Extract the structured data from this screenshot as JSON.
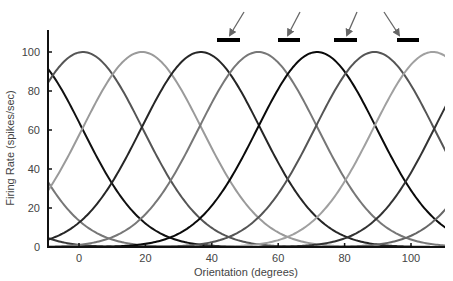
{
  "chart_data": {
    "type": "line",
    "title": "",
    "xlabel": "Orientation (degrees)",
    "ylabel": "Firing Rate (spikes/sec)",
    "xlim": [
      -9.5,
      110
    ],
    "ylim": [
      0,
      100
    ],
    "xticks": [
      0,
      20,
      40,
      60,
      80,
      100
    ],
    "yticks": [
      0,
      20,
      40,
      60,
      80,
      100
    ],
    "grid": false,
    "legend": null,
    "curve_model": "gaussian tuning curve, amplitude 100 spikes/sec, sigma ~18 degrees",
    "series": [
      {
        "name": "neuron pref -54",
        "preferred": -54,
        "amplitude": 100,
        "sigma": 18,
        "color": "#3a3a3a",
        "width": 2
      },
      {
        "name": "neuron pref -36",
        "preferred": -36,
        "amplitude": 100,
        "sigma": 18,
        "color": "#777777",
        "width": 2
      },
      {
        "name": "neuron pref -17",
        "preferred": -17,
        "amplitude": 100,
        "sigma": 18,
        "color": "#111111",
        "width": 2
      },
      {
        "name": "neuron pref 1",
        "preferred": 1.2,
        "amplitude": 100,
        "sigma": 18,
        "color": "#555555",
        "width": 2
      },
      {
        "name": "neuron pref 19",
        "preferred": 19,
        "amplitude": 100,
        "sigma": 18,
        "color": "#9a9a9a",
        "width": 2
      },
      {
        "name": "neuron pref 36",
        "preferred": 36.7,
        "amplitude": 100,
        "sigma": 18,
        "color": "#262626",
        "width": 2
      },
      {
        "name": "neuron pref 54",
        "preferred": 54,
        "amplitude": 100,
        "sigma": 18,
        "color": "#777777",
        "width": 2
      },
      {
        "name": "neuron pref 72",
        "preferred": 71.7,
        "amplitude": 100,
        "sigma": 18,
        "color": "#0a0a0a",
        "width": 2
      },
      {
        "name": "neuron pref 89",
        "preferred": 89,
        "amplitude": 100,
        "sigma": 18,
        "color": "#555555",
        "width": 2
      },
      {
        "name": "neuron pref 107",
        "preferred": 106.6,
        "amplitude": 100,
        "sigma": 18,
        "color": "#a0a0a0",
        "width": 2
      },
      {
        "name": "neuron pref 125",
        "preferred": 125,
        "amplitude": 100,
        "sigma": 18,
        "color": "#333333",
        "width": 2
      },
      {
        "name": "neuron pref 143",
        "preferred": 143,
        "amplitude": 100,
        "sigma": 18,
        "color": "#666666",
        "width": 2
      }
    ],
    "annotations": {
      "stimulus_bars": [
        {
          "orientation_deg": 44.8,
          "x1": 217,
          "x2": 240,
          "y": 40
        },
        {
          "orientation_deg": 63,
          "x1": 278,
          "x2": 300,
          "y": 40
        },
        {
          "orientation_deg": 80,
          "x1": 334,
          "x2": 357,
          "y": 40
        },
        {
          "orientation_deg": 99,
          "x1": 397,
          "x2": 419,
          "y": 40
        }
      ],
      "arrows": [
        {
          "from": [
            244,
            12
          ],
          "to": [
            230,
            35
          ]
        },
        {
          "from": [
            300,
            12
          ],
          "to": [
            288,
            35
          ]
        },
        {
          "from": [
            357,
            12
          ],
          "to": [
            347,
            35
          ]
        },
        {
          "from": [
            384,
            12
          ],
          "to": [
            399,
            35
          ]
        }
      ]
    }
  },
  "layout": {
    "plot": {
      "left": 48,
      "right": 445,
      "top": 30,
      "bottom": 247
    },
    "x_px_per_deg": 3.32,
    "x_zero_px": 79,
    "y_zero_px": 247,
    "y_px_per_unit": 1.95
  },
  "colors": {
    "axis": "#111111",
    "text": "#444444",
    "bar": "#000000",
    "arrow": "#666666"
  }
}
